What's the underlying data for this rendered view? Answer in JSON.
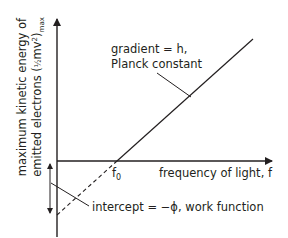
{
  "diagram": {
    "type": "photoelectric-effect-graph",
    "y_axis_label": {
      "line1": "maximum kinetic energy of",
      "line2_prefix": "emitted electrons (",
      "line2_frac": "½",
      "line2_mid": "mv",
      "line2_sup": "2",
      "line2_close": ")",
      "line2_sub": "max"
    },
    "x_axis_label": "frequency of light, f",
    "threshold_label": {
      "base": "f",
      "sub": "0"
    },
    "gradient_annotation": {
      "line1": "gradient = h,",
      "line2": "Planck constant"
    },
    "intercept_annotation": "intercept = −ϕ, work function",
    "colors": {
      "ink": "#231f20",
      "background": "#ffffff"
    }
  }
}
